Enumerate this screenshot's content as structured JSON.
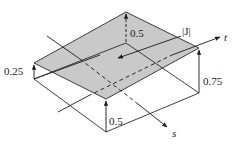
{
  "figure": {
    "surface_color": "#c9c9c9",
    "line_color": "#2a2a2a",
    "labels": {
      "top_height": "0.5",
      "left_height": "0.25",
      "right_height": "0.75",
      "front_height": "0.5",
      "jacobian": "|J|",
      "axis_t": "t",
      "axis_s": "s"
    }
  }
}
